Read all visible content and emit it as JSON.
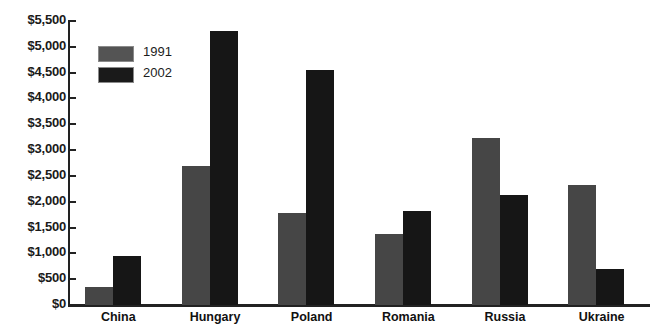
{
  "chart_data": {
    "type": "bar",
    "title": "",
    "xlabel": "",
    "ylabel": "",
    "categories": [
      "China",
      "Hungary",
      "Poland",
      "Romania",
      "Russia",
      "Ukraine"
    ],
    "series": [
      {
        "name": "1991",
        "color": "#464646",
        "values": [
          350,
          2700,
          1780,
          1370,
          3230,
          2330
        ]
      },
      {
        "name": "2002",
        "color": "#161616",
        "values": [
          950,
          5300,
          4550,
          1830,
          2130,
          700
        ]
      }
    ],
    "ylim": [
      0,
      5500
    ],
    "ytick_step": 500,
    "ytick_labels": [
      "$0",
      "$500",
      "$1,000",
      "$1,500",
      "$2,000",
      "$2,500",
      "$3,000",
      "$3,500",
      "$4,000",
      "$4,500",
      "$5,000",
      "$5,500"
    ],
    "ytick_values": [
      0,
      500,
      1000,
      1500,
      2000,
      2500,
      3000,
      3500,
      4000,
      4500,
      5000,
      5500
    ],
    "grid": false,
    "legend_position": "upper-left-inside",
    "legend": [
      {
        "label": "1991",
        "swatch": "#545454"
      },
      {
        "label": "2002",
        "swatch": "#1a1a1a"
      }
    ]
  }
}
